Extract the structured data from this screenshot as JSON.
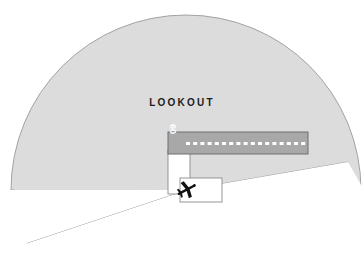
{
  "diagram": {
    "title_overlay": "LOOKOUT",
    "type": "aviation-lookout-sector-diagram",
    "background_color": "#ffffff"
  },
  "lookout_sector": {
    "label": "LOOKOUT",
    "fill_color": "#dcdcdc",
    "stroke_color": "#8c8c8c",
    "apex_x": 186,
    "apex_y": 190,
    "radius": 175,
    "start_angle_deg": 178,
    "end_angle_deg": 350
  },
  "runway": {
    "designator": "09",
    "surface_color": "#a8a8a8",
    "edge_color": "#6e6e6e",
    "centerline_color": "#ffffff",
    "centerline_dashes": 18,
    "x": 168,
    "y": 132,
    "width": 140,
    "height": 22
  },
  "taxiway": {
    "name": "taxiway-to-holding-point",
    "fill_color": "#ffffff",
    "edge_color": "#8a8a8a"
  },
  "holding_bay": {
    "name": "holding-bay-apron",
    "fill_color": "#ffffff",
    "edge_color": "#8a8a8a"
  },
  "aircraft": {
    "label": "aircraft-at-holding-point",
    "color": "#111111",
    "x": 186,
    "y": 190,
    "heading_deg": -28
  }
}
